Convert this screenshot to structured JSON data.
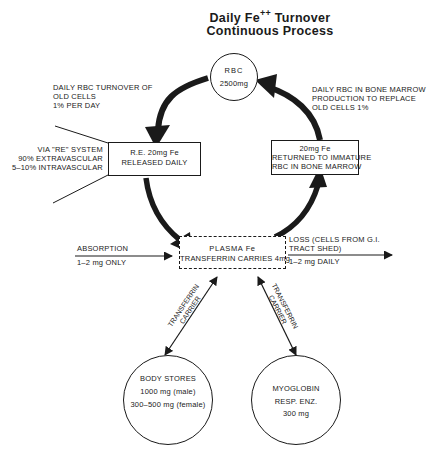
{
  "title": {
    "line1_pre": "Daily Fe",
    "line1_sup": "++",
    "line1_post": " Turnover",
    "line2": "Continuous Process"
  },
  "nodes": {
    "rbc": {
      "label": "RBC",
      "amount": "2500mg"
    },
    "re_box": {
      "line1": "R.E. 20mg  Fe",
      "line2": "RELEASED DAILY"
    },
    "marrow_box": {
      "line1": "20mg  Fe",
      "line2": "RETURNED TO IMMATURE",
      "line3": "RBC IN BONE MARROW"
    },
    "plasma_box": {
      "line1": "PLASMA   Fe",
      "line2": "TRANSFERRIN CARRIES 4mg"
    },
    "body_stores": {
      "line1": "BODY  STORES",
      "line2": "1000  mg  (male)",
      "line3": "300–500  mg  (female)"
    },
    "myoglobin": {
      "line1": "MYOGLOBIN",
      "line2": "RESP. ENZ.",
      "line3": "300 mg"
    }
  },
  "annotations": {
    "turnover": {
      "line1": "DAILY RBC TURNOVER OF",
      "line2": "OLD CELLS",
      "line3": "1% PER DAY"
    },
    "production": {
      "line1": "DAILY RBC IN BONE MARROW",
      "line2": "PRODUCTION TO REPLACE",
      "line3": "OLD CELLS 1%"
    },
    "re_system": {
      "line1": "VIA \"RE\" SYSTEM",
      "line2": "90% EXTRAVASCULAR",
      "line3": "5–10% INTRAVASCULAR"
    },
    "absorption": {
      "line1": "ABSORPTION",
      "line2": "1–2 mg ONLY"
    },
    "loss": {
      "line1": "LOSS (CELLS FROM G.I.",
      "line2": "TRACT SHED)",
      "line3": "1–2 mg DAILY"
    },
    "carrier_left": {
      "line1": "TRANSFERRIN",
      "line2": "CARRIER"
    },
    "carrier_right": {
      "line1": "TRANSFERRIN",
      "line2": "CARRIER"
    }
  },
  "colors": {
    "ink": "#1a1a1a",
    "background": "#ffffff"
  }
}
